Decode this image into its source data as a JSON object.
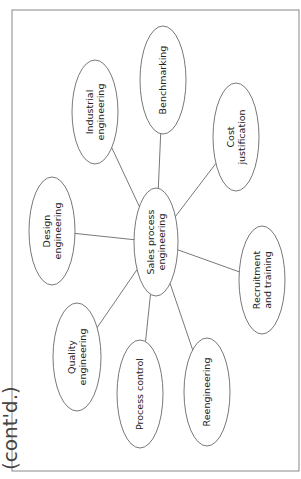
{
  "continuation_label": "(cont'd.)",
  "colors": {
    "stroke": "#555555",
    "text": "#222222",
    "frame": "#888888",
    "background": "#ffffff"
  },
  "frame": {
    "x": 12,
    "y": 10,
    "width": 287,
    "height": 461
  },
  "center": {
    "id": "sales-process-engineering",
    "lines": [
      "Sales process",
      "engineering"
    ],
    "cx": 156,
    "cy": 242,
    "rx": 22,
    "ry": 54
  },
  "nodes": [
    {
      "id": "benchmarking",
      "lines": [
        "Benchmarking"
      ],
      "cx": 163,
      "cy": 80,
      "rx": 23,
      "ry": 54
    },
    {
      "id": "industrial-engineering",
      "lines": [
        "Industrial",
        "engineering"
      ],
      "cx": 95,
      "cy": 112,
      "rx": 23,
      "ry": 52
    },
    {
      "id": "cost-justification",
      "lines": [
        "Cost",
        "justification"
      ],
      "cx": 236,
      "cy": 137,
      "rx": 23,
      "ry": 54
    },
    {
      "id": "design-engineering",
      "lines": [
        "Design",
        "engineering"
      ],
      "cx": 52,
      "cy": 231,
      "rx": 23,
      "ry": 54
    },
    {
      "id": "recruitment-and-training",
      "lines": [
        "Recruitment",
        "and training"
      ],
      "cx": 262,
      "cy": 280,
      "rx": 23,
      "ry": 54
    },
    {
      "id": "quality-engineering",
      "lines": [
        "Quality",
        "engineering"
      ],
      "cx": 77,
      "cy": 357,
      "rx": 24,
      "ry": 54
    },
    {
      "id": "process-control",
      "lines": [
        "Process control"
      ],
      "cx": 140,
      "cy": 394,
      "rx": 23,
      "ry": 54
    },
    {
      "id": "reengineering",
      "lines": [
        "Reengineering"
      ],
      "cx": 207,
      "cy": 392,
      "rx": 23,
      "ry": 54
    }
  ]
}
